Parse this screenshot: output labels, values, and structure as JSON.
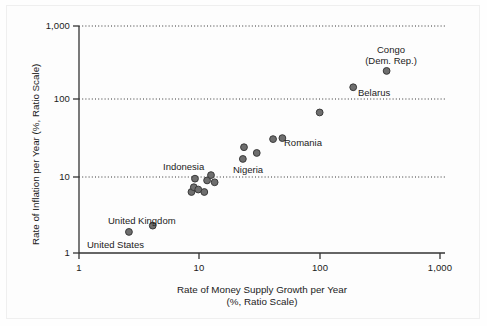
{
  "chart_data": {
    "type": "scatter",
    "title": "",
    "xlabel": "Rate of Money Supply Growth per Year",
    "xlabel_line2": "(%, Ratio Scale)",
    "ylabel": "Rate of Inflation per Year (%, Ratio Scale)",
    "xscale": "log",
    "yscale": "log",
    "xlim": [
      1,
      1000
    ],
    "ylim": [
      1,
      1000
    ],
    "xticks": [
      "1",
      "10",
      "100",
      "1,000"
    ],
    "xtick_values": [
      1,
      10,
      100,
      1000
    ],
    "yticks": [
      "1",
      "10",
      "100",
      "1,000"
    ],
    "ytick_values": [
      1,
      10,
      100,
      1000
    ],
    "grid": "horizontal-dotted",
    "legend": "none",
    "marker_color": "#6e6e6e",
    "marker_edge_color": "#3a3a3a",
    "points": [
      {
        "label": "United States",
        "x": 2.6,
        "y": 1.9
      },
      {
        "label": "United Kingdom",
        "x": 4.1,
        "y": 2.3
      },
      {
        "label": "",
        "x": 8.6,
        "y": 6.4
      },
      {
        "label": "",
        "x": 9.0,
        "y": 7.4
      },
      {
        "label": "",
        "x": 9.2,
        "y": 9.6
      },
      {
        "label": "",
        "x": 9.8,
        "y": 6.9
      },
      {
        "label": "",
        "x": 11.0,
        "y": 6.4
      },
      {
        "label": "Indonesia",
        "x": 11.6,
        "y": 9.1
      },
      {
        "label": "",
        "x": 12.5,
        "y": 10.7
      },
      {
        "label": "",
        "x": 13.4,
        "y": 8.6
      },
      {
        "label": "",
        "x": 23.0,
        "y": 17.5
      },
      {
        "label": "Nigeria",
        "x": 23.5,
        "y": 25.0
      },
      {
        "label": "",
        "x": 30.0,
        "y": 21.0
      },
      {
        "label": "",
        "x": 41.0,
        "y": 32.0
      },
      {
        "label": "Romania",
        "x": 49.0,
        "y": 33.0
      },
      {
        "label": "",
        "x": 100.0,
        "y": 72.0
      },
      {
        "label": "Belarus",
        "x": 190.0,
        "y": 155.0
      },
      {
        "label": "Congo (Dem. Rep.)",
        "x": 360.0,
        "y": 255.0
      }
    ],
    "annotations": [
      {
        "name": "united-states",
        "text": "United States"
      },
      {
        "name": "united-kingdom",
        "text": "United Kingdom"
      },
      {
        "name": "indonesia",
        "text": "Indonesia"
      },
      {
        "name": "nigeria",
        "text": "Nigeria"
      },
      {
        "name": "romania",
        "text": "Romania"
      },
      {
        "name": "belarus",
        "text": "Belarus"
      },
      {
        "name": "congo-line1",
        "text": "Congo"
      },
      {
        "name": "congo-line2",
        "text": "(Dem. Rep.)"
      }
    ]
  },
  "axis": {
    "x_title_line1": "Rate of Money Supply Growth per Year",
    "x_title_line2": "(%, Ratio Scale)",
    "y_title": "Rate of Inflation per Year (%, Ratio Scale)",
    "x_tick_1": "1",
    "x_tick_10": "10",
    "x_tick_100": "100",
    "x_tick_1000": "1,000",
    "y_tick_1": "1",
    "y_tick_10": "10",
    "y_tick_100": "100",
    "y_tick_1000": "1,000"
  }
}
